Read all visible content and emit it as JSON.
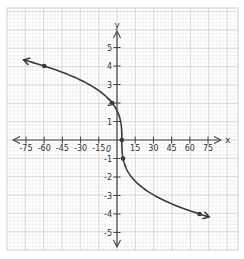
{
  "chart_data": {
    "type": "line",
    "title": "",
    "xlabel": "x",
    "ylabel": "y",
    "function": "y = -cbrt(x - 4)",
    "xlim": [
      -82,
      82
    ],
    "ylim": [
      -5.8,
      6.2
    ],
    "grid": true,
    "x_ticks": [
      -75,
      -60,
      -45,
      -30,
      -15,
      15,
      30,
      45,
      60,
      75
    ],
    "x_tick_labels": [
      "-75",
      "-60",
      "-45",
      "-30",
      "-15",
      "15",
      "30",
      "45",
      "60",
      "75"
    ],
    "y_ticks": [
      5,
      4,
      3,
      2,
      1,
      -1,
      -2,
      -3,
      -4,
      -5
    ],
    "y_tick_labels": [
      "5",
      "4",
      "3",
      "2",
      "1",
      "-1",
      "-2",
      "-3",
      "-4",
      "-5"
    ],
    "origin_label": "0",
    "marked_points": [
      {
        "x": -60,
        "y": 4
      },
      {
        "x": -4,
        "y": 2
      },
      {
        "x": 4,
        "y": 0
      },
      {
        "x": 5,
        "y": -1
      },
      {
        "x": 68,
        "y": -4
      }
    ],
    "curve_domain": [
      -77,
      76
    ],
    "arrows": "both ends",
    "colors": {
      "curve": "#3a3a3a",
      "axis": "#444444",
      "grid_major": "#d6d6d6",
      "grid_minor": "#ececec"
    }
  },
  "axes": {
    "x_label": "x",
    "y_label": "y",
    "origin": "0"
  }
}
